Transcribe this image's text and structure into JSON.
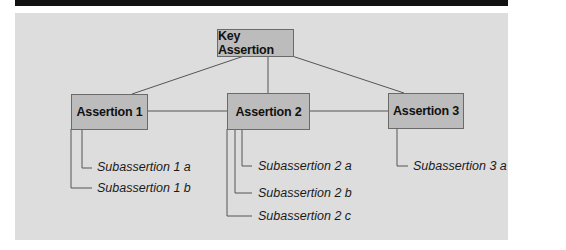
{
  "diagram": {
    "type": "hierarchy",
    "root": {
      "label": "Key Assertion"
    },
    "assertions": [
      {
        "label": "Assertion 1",
        "subassertions": [
          "Subassertion 1 a",
          "Subassertion 1 b"
        ]
      },
      {
        "label": "Assertion 2",
        "subassertions": [
          "Subassertion 2 a",
          "Subassertion 2 b",
          "Subassertion 2 c"
        ]
      },
      {
        "label": "Assertion 3",
        "subassertions": [
          "Subassertion 3 a"
        ]
      }
    ],
    "colors": {
      "top_bar": "#111111",
      "panel_background": "#dddddd",
      "node_fill": "#bcbcbc",
      "node_border": "#6a6a6a",
      "connector": "#555555"
    }
  }
}
